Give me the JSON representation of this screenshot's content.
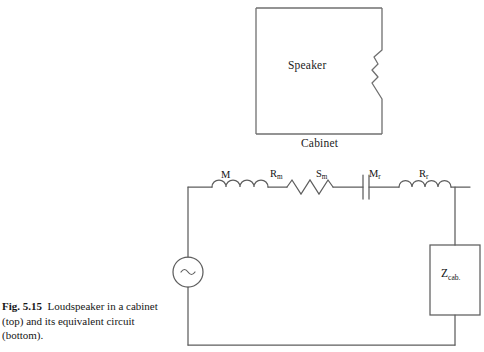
{
  "figure": {
    "number_label": "Fig. 5.15",
    "caption_text": "Loudspeaker in a cabinet (top) and its equivalent circuit (bottom).",
    "colors": {
      "ink": "#1a1a1a",
      "line": "#6f6f6f",
      "circuit_line": "#5e5e5e",
      "background": "#ffffff"
    }
  },
  "top_diagram": {
    "name": "loudspeaker-cabinet",
    "inner_label": "Speaker",
    "below_label": "Cabinet",
    "box": {
      "x": 6,
      "y": 8,
      "width": 132,
      "height": 126
    },
    "driver": {
      "description": "speaker-cone-notch-on-right-wall",
      "y_top": 50,
      "y_bottom": 99
    }
  },
  "bottom_diagram": {
    "name": "equivalent-circuit",
    "source": {
      "symbol": "~",
      "type": "ac-voltage-source"
    },
    "components": [
      {
        "id": "m",
        "type": "inductor",
        "label": "M",
        "sub": ""
      },
      {
        "id": "rm",
        "type": "resistor",
        "label": "R",
        "sub": "m"
      },
      {
        "id": "sm",
        "type": "capacitor",
        "label": "S",
        "sub": "m"
      },
      {
        "id": "mr",
        "type": "inductor",
        "label": "M",
        "sub": "r"
      },
      {
        "id": "rr",
        "type": "resistor",
        "label": "R",
        "sub": "r"
      }
    ],
    "load": {
      "label": "Z",
      "sub": "cab.",
      "type": "impedance-box"
    }
  }
}
